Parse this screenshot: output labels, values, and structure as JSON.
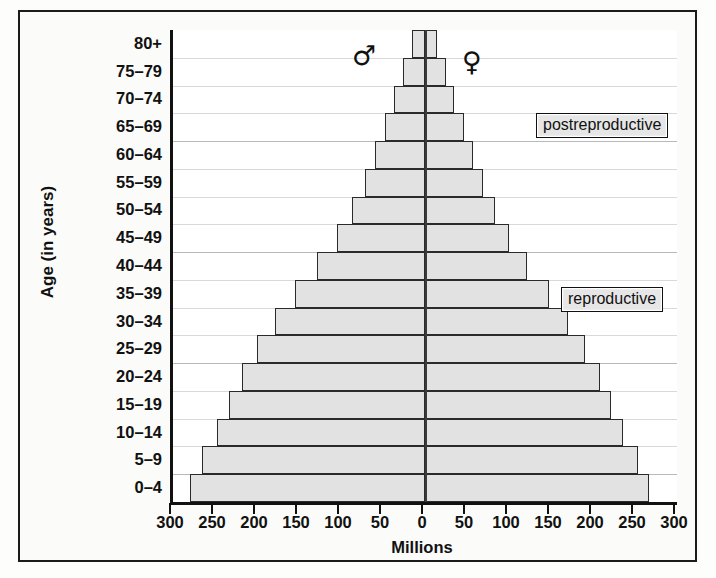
{
  "chart_data": {
    "type": "bar",
    "subtype": "population-pyramid",
    "title": "",
    "xlabel": "Millions",
    "ylabel": "Age (in years)",
    "categories": [
      "0–4",
      "5–9",
      "10–14",
      "15–19",
      "20–24",
      "25–29",
      "30–34",
      "35–39",
      "40–44",
      "45–49",
      "50–54",
      "55–59",
      "60–64",
      "65–69",
      "70–74",
      "75–79",
      "80+"
    ],
    "series": [
      {
        "name": "♂",
        "side": "left",
        "values": [
          280,
          265,
          248,
          233,
          218,
          200,
          178,
          155,
          128,
          105,
          87,
          72,
          60,
          48,
          37,
          26,
          15
        ]
      },
      {
        "name": "♀",
        "side": "right",
        "values": [
          267,
          253,
          236,
          222,
          208,
          191,
          170,
          148,
          122,
          100,
          83,
          69,
          57,
          46,
          35,
          25,
          14
        ]
      }
    ],
    "xticks_left": [
      300,
      250,
      200,
      150,
      100,
      50
    ],
    "xtick_center": 0,
    "xticks_right": [
      50,
      100,
      150,
      200,
      250,
      300
    ],
    "xtick_labels": [
      "300",
      "250",
      "200",
      "150",
      "100",
      "50",
      "0",
      "50",
      "100",
      "150",
      "200",
      "250",
      "300"
    ],
    "xlim": [
      -300,
      300
    ],
    "xtick_step": 50,
    "grid": true,
    "legend_position": "inline-top",
    "bar_fill_color": "#e2e2e2",
    "bar_border_color": "#2a2a2a",
    "axis_color": "#111111",
    "gridline_color": "#d9d9d9"
  },
  "axes": {
    "y_axis_title": "Age (in years)",
    "x_axis_title": "Millions"
  },
  "symbols": {
    "male": "♂",
    "female": "♀"
  },
  "annotations": {
    "postreproductive": "postreproductive",
    "reproductive": "reproductive"
  }
}
